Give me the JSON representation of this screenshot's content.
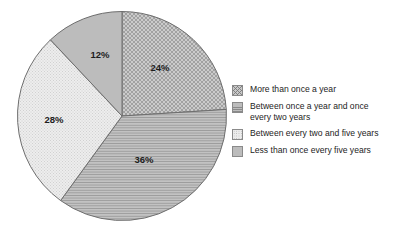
{
  "chart_data": {
    "type": "pie",
    "title": "",
    "categories": [
      "More than once a year",
      "Between once a year and once every two years",
      "Between every two and five years",
      "Less than once every five years"
    ],
    "values": [
      24,
      36,
      28,
      12
    ],
    "value_labels": [
      "24%",
      "36%",
      "28%",
      "12%"
    ],
    "value_unit": "%",
    "start_angle_deg": 0,
    "direction": "clockwise",
    "legend_position": "right",
    "grid": false,
    "colors": [
      "#c8c8c8",
      "#bdbdbd",
      "#ececec",
      "#bcbcbc"
    ],
    "patterns": [
      "crosshatch",
      "horizontal-lines",
      "fine-dots",
      "solid"
    ],
    "outline_color": "#6e6e6e"
  },
  "pie": {
    "slices": [
      {
        "label": "24%",
        "value": 24,
        "pattern": "crosshatch",
        "label_x": 160,
        "label_y": 68
      },
      {
        "label": "36%",
        "value": 36,
        "pattern": "horizontal-lines",
        "label_x": 144,
        "label_y": 160
      },
      {
        "label": "28%",
        "value": 28,
        "pattern": "fine-dots",
        "label_x": 54,
        "label_y": 120
      },
      {
        "label": "12%",
        "value": 12,
        "pattern": "solid",
        "label_x": 100,
        "label_y": 55
      }
    ]
  },
  "legend": {
    "items": [
      {
        "label": "More than once a year",
        "swatch": "crosshatch"
      },
      {
        "label": "Between once a year and once\nevery two years",
        "swatch": "horizontal-lines"
      },
      {
        "label": "Between every two and five years",
        "swatch": "fine-dots"
      },
      {
        "label": "Less than once every five years",
        "swatch": "solid"
      }
    ]
  }
}
